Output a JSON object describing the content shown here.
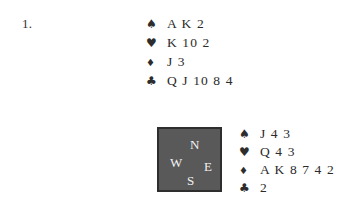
{
  "page": {
    "background_color": "#ffffff",
    "text_color": "#2b2b2b"
  },
  "problem": {
    "number_label": "1."
  },
  "suits": {
    "spade_glyph": "♠",
    "heart_glyph": "♥",
    "diamond_glyph": "♦",
    "club_glyph": "♣"
  },
  "hands": {
    "north": {
      "position": "north",
      "rows": [
        {
          "suit": "spades",
          "glyph": "♠",
          "cards": "A K 2"
        },
        {
          "suit": "hearts",
          "glyph": "♥",
          "cards": "K 10 2"
        },
        {
          "suit": "diamonds",
          "glyph": "♦",
          "cards": "J 3"
        },
        {
          "suit": "clubs",
          "glyph": "♣",
          "cards": "Q J 10 8 4"
        }
      ]
    },
    "east": {
      "position": "east",
      "rows": [
        {
          "suit": "spades",
          "glyph": "♠",
          "cards": "J 4 3"
        },
        {
          "suit": "hearts",
          "glyph": "♥",
          "cards": "Q 4 3"
        },
        {
          "suit": "diamonds",
          "glyph": "♦",
          "cards": "A K 8 7 4 2"
        },
        {
          "suit": "clubs",
          "glyph": "♣",
          "cards": "2"
        }
      ]
    }
  },
  "compass": {
    "fill_color": "#595959",
    "border_color": "#2e2e2e",
    "letter_color": "#f2f2f2",
    "north": "N",
    "west": "W",
    "east": "E",
    "south": "S"
  }
}
